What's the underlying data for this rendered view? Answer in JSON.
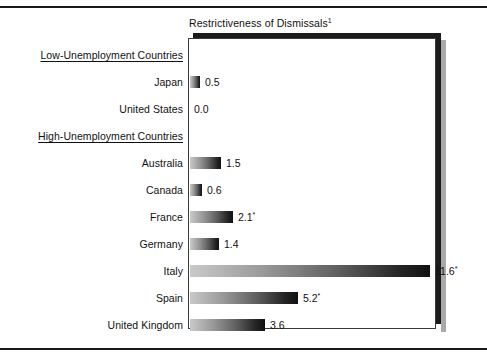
{
  "chart_data": {
    "type": "bar",
    "title": "Restrictiveness of Dismissals",
    "title_superscript": "1",
    "orientation": "horizontal",
    "xlabel": "",
    "ylabel": "",
    "xlim": [
      0,
      12
    ],
    "grid": false,
    "legend": null,
    "groups": [
      {
        "label": "Low-Unemployment Countries",
        "categories": [
          "Japan",
          "United States"
        ],
        "values": [
          0.5,
          0.0
        ],
        "value_labels": [
          "0.5",
          "0.0"
        ]
      },
      {
        "label": "High-Unemployment Countries",
        "categories": [
          "Australia",
          "Canada",
          "France",
          "Germany",
          "Italy",
          "Spain",
          "United Kingdom"
        ],
        "values": [
          1.5,
          0.6,
          2.1,
          1.4,
          11.6,
          5.2,
          3.6
        ],
        "value_labels": [
          "1.5",
          "0.6",
          "2.1*",
          "1.4",
          "11.6*",
          "5.2*",
          "3.6"
        ]
      }
    ],
    "categories": [
      "Japan",
      "United States",
      "Australia",
      "Canada",
      "France",
      "Germany",
      "Italy",
      "Spain",
      "United Kingdom"
    ],
    "values": [
      0.5,
      0.0,
      1.5,
      0.6,
      2.1,
      1.4,
      11.6,
      5.2,
      3.6
    ]
  },
  "rows": [
    {
      "kind": "group",
      "label": "Low-Unemployment Countries",
      "value": null,
      "value_label": ""
    },
    {
      "kind": "bar",
      "label": "Japan",
      "value": 0.5,
      "value_label": "0.5"
    },
    {
      "kind": "bar",
      "label": "United States",
      "value": 0.0,
      "value_label": "0.0"
    },
    {
      "kind": "group",
      "label": "High-Unemployment Countries",
      "value": null,
      "value_label": ""
    },
    {
      "kind": "bar",
      "label": "Australia",
      "value": 1.5,
      "value_label": "1.5"
    },
    {
      "kind": "bar",
      "label": "Canada",
      "value": 0.6,
      "value_label": "0.6"
    },
    {
      "kind": "bar",
      "label": "France",
      "value": 2.1,
      "value_label": "2.1",
      "marker": "*"
    },
    {
      "kind": "bar",
      "label": "Germany",
      "value": 1.4,
      "value_label": "1.4"
    },
    {
      "kind": "bar",
      "label": "Italy",
      "value": 11.6,
      "value_label": "11.6",
      "marker": "*"
    },
    {
      "kind": "bar",
      "label": "Spain",
      "value": 5.2,
      "value_label": "5.2",
      "marker": "*"
    },
    {
      "kind": "bar",
      "label": "United Kingdom",
      "value": 3.6,
      "value_label": "3.6"
    }
  ],
  "colors": {
    "bar_gradient_start": "#c9c9c9",
    "bar_gradient_end": "#111111",
    "frame": "#3a3a3a",
    "shadow": "#1b1b1b",
    "text": "#111111",
    "background": "#ffffff"
  },
  "layout": {
    "plot_left": 188,
    "plot_top": 38,
    "plot_width": 248,
    "plot_height": 291,
    "bar_origin_x": 190,
    "px_per_unit": 20.7,
    "first_row_y": 45,
    "row_step": 27
  }
}
